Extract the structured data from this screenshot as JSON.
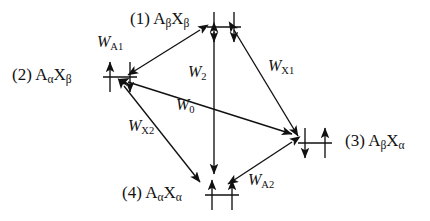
{
  "figure": {
    "kind": "spin-state-transition-diagram",
    "ink_color": "#111111",
    "background_color": "#ffffff"
  },
  "states": [
    {
      "id": "state-1",
      "index": "(1)",
      "species_a": "A",
      "sub_a": "β",
      "species_x": "X",
      "sub_x": "β",
      "label": "(1) AβXβ",
      "spins": [
        "down",
        "down"
      ],
      "label_x": 130,
      "label_y": 10,
      "symbol_x": 207,
      "symbol_y": 12
    },
    {
      "id": "state-2",
      "index": "(2)",
      "species_a": "A",
      "sub_a": "α",
      "species_x": "X",
      "sub_x": "β",
      "label": "(2) AαXβ",
      "spins": [
        "up",
        "down"
      ],
      "label_x": 12,
      "label_y": 66,
      "symbol_x": 103,
      "symbol_y": 62
    },
    {
      "id": "state-3",
      "index": "(3)",
      "species_a": "A",
      "sub_a": "β",
      "species_x": "X",
      "sub_x": "α",
      "label": "(3) AβXα",
      "spins": [
        "down",
        "up"
      ],
      "label_x": 345,
      "label_y": 132,
      "symbol_x": 298,
      "symbol_y": 128
    },
    {
      "id": "state-4",
      "index": "(4)",
      "species_a": "A",
      "sub_a": "α",
      "species_x": "X",
      "sub_x": "α",
      "label": "(4) AαXα",
      "spins": [
        "up",
        "up"
      ],
      "label_x": 122,
      "label_y": 184,
      "symbol_x": 205,
      "symbol_y": 180
    }
  ],
  "transitions": [
    {
      "id": "rate-WA1",
      "symbol": "W",
      "sub": "A1",
      "label": "WA1",
      "from": "state-1",
      "to": "state-2",
      "x1": 200,
      "y1": 30,
      "x2": 128,
      "y2": 75,
      "label_x": 97,
      "label_y": 34
    },
    {
      "id": "rate-WX1",
      "symbol": "W",
      "sub": "X1",
      "label": "WX1",
      "from": "state-1",
      "to": "state-3",
      "x1": 234,
      "y1": 30,
      "x2": 298,
      "y2": 136,
      "label_x": 268,
      "label_y": 58
    },
    {
      "id": "rate-W2",
      "symbol": "W",
      "sub": "2",
      "label": "W2",
      "from": "state-1",
      "to": "state-4",
      "x1": 214,
      "y1": 32,
      "x2": 214,
      "y2": 174,
      "label_x": 188,
      "label_y": 64
    },
    {
      "id": "rate-W0",
      "symbol": "W",
      "sub": "0",
      "label": "W0",
      "from": "state-2",
      "to": "state-3",
      "x1": 128,
      "y1": 82,
      "x2": 292,
      "y2": 134,
      "label_x": 176,
      "label_y": 97
    },
    {
      "id": "rate-WX2",
      "symbol": "W",
      "sub": "X2",
      "label": "WX2",
      "from": "state-2",
      "to": "state-4",
      "x1": 124,
      "y1": 86,
      "x2": 200,
      "y2": 182,
      "label_x": 128,
      "label_y": 118
    },
    {
      "id": "rate-WA2",
      "symbol": "W",
      "sub": "A2",
      "label": "WA2",
      "from": "state-3",
      "to": "state-4",
      "x1": 292,
      "y1": 142,
      "x2": 228,
      "y2": 184,
      "label_x": 248,
      "label_y": 172
    }
  ]
}
